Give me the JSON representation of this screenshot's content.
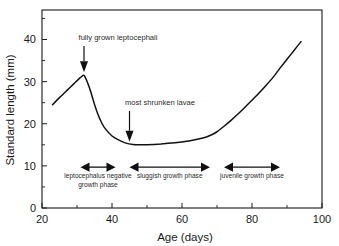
{
  "chart_data": {
    "type": "line",
    "title": "",
    "xlabel": "Age (days)",
    "ylabel": "Standard length (mm)",
    "xlim": [
      20,
      100
    ],
    "ylim": [
      0,
      47
    ],
    "grid": false,
    "legend": "none",
    "x_ticks": [
      20,
      40,
      60,
      80,
      100
    ],
    "x_tick_labels": [
      "20",
      "40",
      "60",
      "80",
      "100"
    ],
    "x_minor_ticks": [
      30,
      50,
      70,
      90
    ],
    "y_ticks": [
      0,
      10,
      20,
      30,
      40
    ],
    "y_tick_labels": [
      "0",
      "10",
      "20",
      "30",
      "40"
    ],
    "y_minor_ticks": [
      5,
      15,
      25,
      35,
      45
    ],
    "series": [
      {
        "name": "standard length",
        "x": [
          23,
          25,
          27,
          29,
          31,
          32,
          33,
          34,
          35,
          36,
          37,
          38,
          40,
          42,
          44,
          46,
          48,
          50,
          54,
          58,
          62,
          66,
          68,
          70,
          72,
          74,
          76,
          78,
          80,
          82,
          84,
          86,
          88,
          90,
          92,
          94
        ],
        "values": [
          24.5,
          26.2,
          27.8,
          29.4,
          31.0,
          31.5,
          29.8,
          27.4,
          24.6,
          22.2,
          20.3,
          18.9,
          17.1,
          16.1,
          15.4,
          15.1,
          15.0,
          15.0,
          15.2,
          15.5,
          15.9,
          16.6,
          17.2,
          18.1,
          19.4,
          20.8,
          22.3,
          23.9,
          25.6,
          27.3,
          29.1,
          31.0,
          33.2,
          35.3,
          37.4,
          39.5
        ]
      }
    ],
    "annotations": [
      {
        "label": "fully grown leptocephali",
        "x": 32,
        "y": 31.5,
        "note": "arrow down to peak"
      },
      {
        "label": "most shrunken lavae",
        "x": 45,
        "y": 15.0,
        "note": "arrow down to minimum"
      }
    ],
    "phase_markers": [
      {
        "label": "leptocephalus negative growth phase",
        "x_start": 31,
        "x_end": 41,
        "y": 9.7
      },
      {
        "label": "sluggish growth phase",
        "x_start": 45,
        "x_end": 68,
        "y": 9.7
      },
      {
        "label": "juvenile growth phase",
        "x_start": 72,
        "x_end": 88,
        "y": 9.7
      }
    ],
    "colors": {
      "curve": "#111111",
      "axis": "#1a1a1a",
      "text": "#2b2b2b",
      "background": "#ffffff"
    }
  }
}
